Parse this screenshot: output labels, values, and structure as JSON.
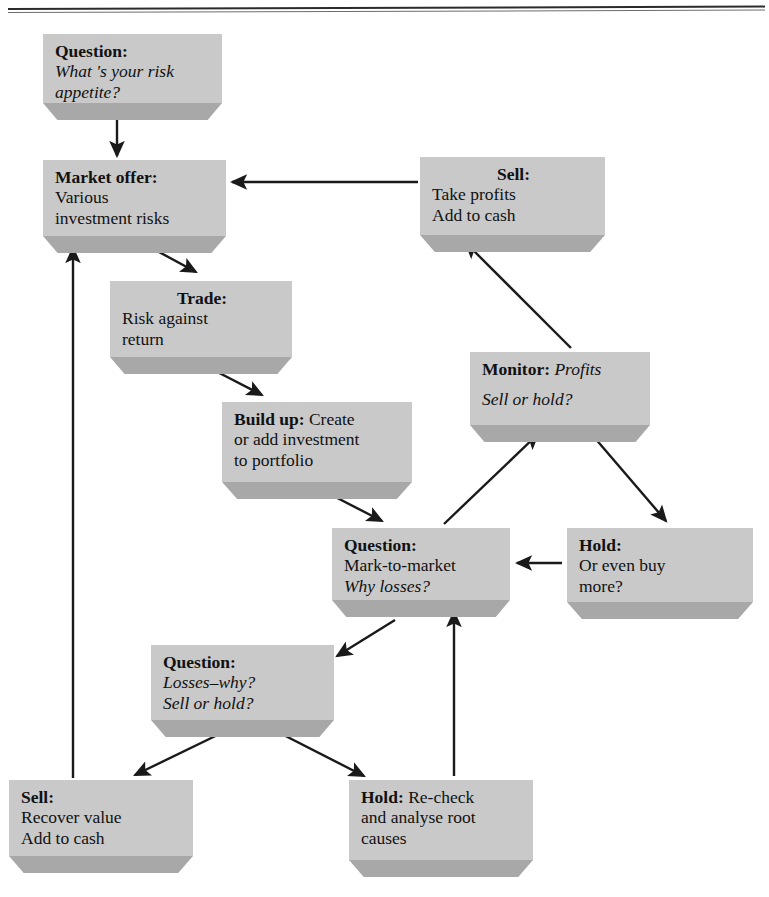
{
  "page": {
    "background_color": "#ffffff",
    "box_face_color": "#c9c9c9",
    "box_side_color": "#a8a8a8",
    "line_color": "#1a1a1a"
  },
  "nodes": [
    {
      "id": "question-risk-appetite",
      "name": "question-risk-appetite-box",
      "heading": "Question:",
      "lines": [
        "What 's your risk",
        "appetite?"
      ],
      "heading_style": "bold",
      "body_style": "italic",
      "align": "left"
    },
    {
      "id": "market-offer",
      "name": "market-offer-box",
      "heading": "Market offer:",
      "lines": [
        "Various",
        "investment risks"
      ],
      "heading_style": "bold",
      "body_style": "normal",
      "align": "left"
    },
    {
      "id": "sell-take-profits",
      "name": "sell-take-profits-box",
      "heading": "Sell:",
      "lines": [
        "Take profits",
        "Add to cash"
      ],
      "heading_style": "bold",
      "body_style": "normal",
      "align": "center-heading"
    },
    {
      "id": "trade",
      "name": "trade-box",
      "heading": "Trade:",
      "lines": [
        "Risk against",
        "return"
      ],
      "heading_style": "bold",
      "body_style": "normal",
      "align": "center-heading"
    },
    {
      "id": "build-up",
      "name": "build-up-box",
      "heading": "Build up:",
      "lines": [
        " Create",
        "or add investment",
        "to portfolio"
      ],
      "heading_style": "bold",
      "body_style": "normal",
      "align": "inline"
    },
    {
      "id": "monitor-profits",
      "name": "monitor-profits-box",
      "heading": "Monitor:",
      "lines": [
        " Profits",
        "Sell or hold?"
      ],
      "heading_style": "bold",
      "body_style": "italic",
      "align": "inline"
    },
    {
      "id": "question-mark-to-market",
      "name": "question-mark-to-market-box",
      "heading": "Question:",
      "lines": [
        "Mark-to-market",
        "Why losses?"
      ],
      "heading_style": "bold",
      "body_style": "mixed",
      "align": "left"
    },
    {
      "id": "hold-buy-more",
      "name": "hold-buy-more-box",
      "heading": "Hold:",
      "lines": [
        "Or even buy",
        "more?"
      ],
      "heading_style": "bold",
      "body_style": "normal",
      "align": "left"
    },
    {
      "id": "question-losses-why",
      "name": "question-losses-why-box",
      "heading": "Question:",
      "lines": [
        "Losses–why?",
        "Sell or hold?"
      ],
      "heading_style": "bold",
      "body_style": "italic",
      "align": "left"
    },
    {
      "id": "sell-recover-value",
      "name": "sell-recover-value-box",
      "heading": "Sell:",
      "lines": [
        "Recover value",
        "Add to cash"
      ],
      "heading_style": "bold",
      "body_style": "normal",
      "align": "left"
    },
    {
      "id": "hold-recheck",
      "name": "hold-recheck-box",
      "heading": "Hold:",
      "lines": [
        " Re-check",
        "and analyse root",
        "causes"
      ],
      "heading_style": "bold",
      "body_style": "normal",
      "align": "inline"
    }
  ],
  "text": {
    "question_risk": {
      "heading": "Question:",
      "l1": "What 's your risk",
      "l2": "appetite?"
    },
    "market_offer": {
      "heading": "Market offer:",
      "l1": "Various",
      "l2": "investment risks"
    },
    "sell_profits": {
      "heading": "Sell:",
      "l1": "Take profits",
      "l2": "Add to cash"
    },
    "trade": {
      "heading": "Trade:",
      "l1": "Risk against",
      "l2": "return"
    },
    "build_up": {
      "heading": "Build up:",
      "l1": "Create",
      "l2": "or add investment",
      "l3": "to portfolio"
    },
    "monitor": {
      "heading": "Monitor:",
      "l1": "Profits",
      "l2": "Sell or hold?"
    },
    "question_mtm": {
      "heading": "Question:",
      "l1": "Mark-to-market",
      "l2": "Why losses?"
    },
    "hold_buy": {
      "heading": "Hold:",
      "l1": "Or even buy",
      "l2": "more?"
    },
    "question_losses": {
      "heading": "Question:",
      "l1": "Losses–why?",
      "l2": "Sell or hold?"
    },
    "sell_recover": {
      "heading": "Sell:",
      "l1": "Recover value",
      "l2": "Add to cash"
    },
    "hold_recheck": {
      "heading": "Hold:",
      "l1": "Re-check",
      "l2": "and analyse root",
      "l3": "causes"
    }
  },
  "edges": [
    {
      "name": "edge-question-risk-to-market-offer",
      "from": "question-risk-appetite",
      "to": "market-offer",
      "style": "straight-vertical"
    },
    {
      "name": "edge-market-offer-to-trade",
      "from": "market-offer",
      "to": "trade",
      "style": "diagonal"
    },
    {
      "name": "edge-trade-to-build-up",
      "from": "trade",
      "to": "build-up",
      "style": "diagonal"
    },
    {
      "name": "edge-build-up-to-question-mtm",
      "from": "build-up",
      "to": "question-mark-to-market",
      "style": "diagonal"
    },
    {
      "name": "edge-question-mtm-to-monitor",
      "from": "question-mark-to-market",
      "to": "monitor-profits",
      "style": "diagonal"
    },
    {
      "name": "edge-monitor-to-sell-profits",
      "from": "monitor-profits",
      "to": "sell-take-profits",
      "style": "diagonal"
    },
    {
      "name": "edge-monitor-to-hold-buy-more",
      "from": "monitor-profits",
      "to": "hold-buy-more",
      "style": "diagonal"
    },
    {
      "name": "edge-hold-buy-more-to-question-mtm",
      "from": "hold-buy-more",
      "to": "question-mark-to-market",
      "style": "straight-horizontal"
    },
    {
      "name": "edge-sell-profits-to-market-offer",
      "from": "sell-take-profits",
      "to": "market-offer",
      "style": "straight-horizontal"
    },
    {
      "name": "edge-question-mtm-to-question-losses",
      "from": "question-mark-to-market",
      "to": "question-losses-why",
      "style": "diagonal"
    },
    {
      "name": "edge-question-losses-to-sell-recover",
      "from": "question-losses-why",
      "to": "sell-recover-value",
      "style": "diagonal"
    },
    {
      "name": "edge-question-losses-to-hold-recheck",
      "from": "question-losses-why",
      "to": "hold-recheck",
      "style": "diagonal"
    },
    {
      "name": "edge-hold-recheck-to-question-mtm",
      "from": "hold-recheck",
      "to": "question-mark-to-market",
      "style": "straight-vertical"
    },
    {
      "name": "edge-sell-recover-to-market-offer",
      "from": "sell-recover-value",
      "to": "market-offer",
      "style": "straight-vertical-long"
    }
  ]
}
